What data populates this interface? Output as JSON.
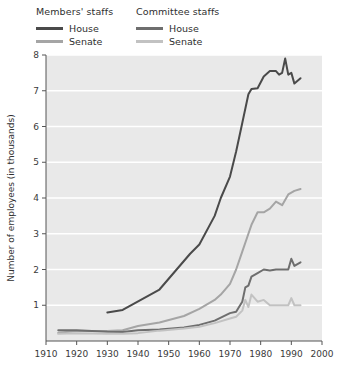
{
  "legend": {
    "groups": [
      {
        "name": "members-staffs",
        "title": "Members' staffs",
        "entries": [
          {
            "label": "House",
            "color": "#4a4a4a"
          },
          {
            "label": "Senate",
            "color": "#a5a5a5"
          }
        ]
      },
      {
        "name": "committee-staffs",
        "title": "Committee staffs",
        "entries": [
          {
            "label": "House",
            "color": "#6e6e6e"
          },
          {
            "label": "Senate",
            "color": "#c2c2c2"
          }
        ]
      }
    ]
  },
  "chart_data": {
    "type": "line",
    "title": "",
    "xlabel": "",
    "ylabel": "Number of employees (in thousands)",
    "xlim": [
      1910,
      2000
    ],
    "ylim": [
      0,
      8
    ],
    "xticks": [
      1910,
      1920,
      1930,
      1940,
      1950,
      1960,
      1970,
      1980,
      1990,
      2000
    ],
    "yticks": [
      1,
      2,
      3,
      4,
      5,
      6,
      7,
      8
    ],
    "grid": "horizontal-white",
    "legend_position": "above-plot-left",
    "series": [
      {
        "name": "Members' staffs — House",
        "color": "#4a4a4a",
        "width": 2.0,
        "x": [
          1930,
          1935,
          1947,
          1957,
          1960,
          1965,
          1967,
          1970,
          1972,
          1974,
          1976,
          1977,
          1979,
          1981,
          1983,
          1985,
          1986,
          1987,
          1988,
          1989,
          1990,
          1991,
          1993
        ],
        "y": [
          0.8,
          0.87,
          1.44,
          2.44,
          2.7,
          3.5,
          4.0,
          4.6,
          5.3,
          6.1,
          6.9,
          7.05,
          7.07,
          7.4,
          7.55,
          7.55,
          7.45,
          7.5,
          7.9,
          7.45,
          7.5,
          7.2,
          7.35
        ]
      },
      {
        "name": "Members' staffs — Senate",
        "color": "#a5a5a5",
        "width": 2.0,
        "x": [
          1914,
          1920,
          1930,
          1935,
          1940,
          1947,
          1955,
          1960,
          1965,
          1967,
          1970,
          1972,
          1974,
          1976,
          1977,
          1979,
          1981,
          1983,
          1985,
          1987,
          1989,
          1991,
          1993
        ],
        "y": [
          0.23,
          0.28,
          0.28,
          0.3,
          0.42,
          0.52,
          0.7,
          0.9,
          1.15,
          1.3,
          1.6,
          2.0,
          2.5,
          3.0,
          3.25,
          3.6,
          3.6,
          3.7,
          3.9,
          3.8,
          4.1,
          4.2,
          4.25
        ]
      },
      {
        "name": "Committee staffs — House",
        "color": "#6e6e6e",
        "width": 2.0,
        "x": [
          1914,
          1920,
          1930,
          1935,
          1940,
          1947,
          1955,
          1960,
          1965,
          1970,
          1972,
          1974,
          1975,
          1976,
          1977,
          1979,
          1981,
          1983,
          1985,
          1987,
          1989,
          1990,
          1991,
          1993
        ],
        "y": [
          0.3,
          0.3,
          0.26,
          0.25,
          0.3,
          0.32,
          0.38,
          0.45,
          0.57,
          0.78,
          0.82,
          1.1,
          1.5,
          1.55,
          1.8,
          1.9,
          2.0,
          1.97,
          2.0,
          2.0,
          2.0,
          2.3,
          2.1,
          2.2
        ]
      },
      {
        "name": "Committee staffs — Senate",
        "color": "#c2c2c2",
        "width": 2.0,
        "x": [
          1914,
          1920,
          1930,
          1935,
          1940,
          1947,
          1955,
          1960,
          1965,
          1970,
          1972,
          1974,
          1975,
          1976,
          1977,
          1979,
          1981,
          1983,
          1985,
          1987,
          1989,
          1990,
          1991,
          1993
        ],
        "y": [
          0.2,
          0.22,
          0.2,
          0.2,
          0.22,
          0.29,
          0.35,
          0.4,
          0.5,
          0.63,
          0.68,
          0.85,
          1.15,
          0.95,
          1.3,
          1.1,
          1.15,
          1.0,
          1.0,
          1.0,
          1.0,
          1.2,
          1.0,
          1.0
        ]
      }
    ]
  }
}
